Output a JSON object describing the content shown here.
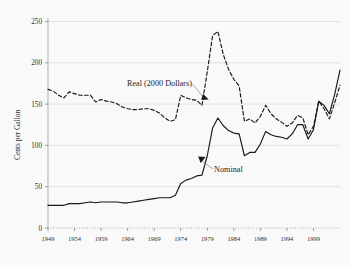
{
  "figure": {
    "kind": "scanned-line-chart",
    "background_color": "#ffffff",
    "ink_color": "#111111",
    "gridline_color": "#d9d9d9",
    "axis_color": "#8c8c8c"
  },
  "axes": {
    "y_title": "Cents per Gallon",
    "y_ticks": [
      "0",
      "50",
      "100",
      "150",
      "200",
      "250"
    ],
    "x_ticks": [
      "1949",
      "1954",
      "1959",
      "1964",
      "1969",
      "1974",
      "1979",
      "1984",
      "1989",
      "1994",
      "1999"
    ]
  },
  "annotations": {
    "real_label": "Real (2000 Dollars)",
    "nominal_label": "Nominal"
  },
  "chart_data": {
    "type": "line",
    "title": "",
    "subtitle": "",
    "xlabel": "",
    "ylabel": "Cents per Gallon",
    "xlim": [
      1949,
      2004
    ],
    "ylim": [
      0,
      250
    ],
    "grid": "horizontal",
    "legend_position": "inline-annotations",
    "x_tick_interval": 5,
    "y_tick_interval": 50,
    "x": [
      1949,
      1950,
      1951,
      1952,
      1953,
      1954,
      1955,
      1956,
      1957,
      1958,
      1959,
      1960,
      1961,
      1962,
      1963,
      1964,
      1965,
      1966,
      1967,
      1968,
      1969,
      1970,
      1971,
      1972,
      1973,
      1974,
      1975,
      1976,
      1977,
      1978,
      1979,
      1980,
      1981,
      1982,
      1983,
      1984,
      1985,
      1986,
      1987,
      1988,
      1989,
      1990,
      1991,
      1992,
      1993,
      1994,
      1995,
      1996,
      1997,
      1998,
      1999,
      2000,
      2001,
      2002,
      2003,
      2004
    ],
    "series": [
      {
        "name": "Nominal",
        "style": "solid",
        "values": [
          27,
          27,
          27,
          27,
          29,
          29,
          29,
          30,
          31,
          30,
          31,
          31,
          31,
          31,
          30,
          30,
          31,
          32,
          33,
          34,
          35,
          36,
          36,
          36,
          39,
          53,
          57,
          59,
          62,
          63,
          86,
          119,
          131,
          122,
          116,
          113,
          112,
          86,
          90,
          90,
          100,
          115,
          111,
          109,
          108,
          106,
          112,
          123,
          123,
          106,
          117,
          151,
          146,
          136,
          159,
          188
        ]
      },
      {
        "name": "Real (2000 Dollars)",
        "style": "dashed",
        "values": [
          165,
          163,
          158,
          155,
          162,
          160,
          158,
          158,
          158,
          150,
          153,
          151,
          150,
          148,
          144,
          142,
          141,
          141,
          142,
          142,
          140,
          137,
          131,
          127,
          129,
          158,
          155,
          153,
          152,
          146,
          186,
          229,
          234,
          207,
          189,
          177,
          169,
          127,
          130,
          125,
          133,
          146,
          136,
          130,
          126,
          121,
          125,
          134,
          131,
          111,
          121,
          151,
          142,
          130,
          149,
          170
        ]
      }
    ]
  }
}
